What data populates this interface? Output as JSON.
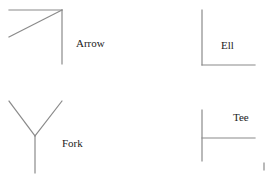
{
  "diagram": {
    "line_color": "#8a8a8a",
    "text_color": "#222222",
    "junctions": [
      {
        "name": "arrow",
        "label": "Arrow"
      },
      {
        "name": "ell",
        "label": "Ell"
      },
      {
        "name": "fork",
        "label": "Fork"
      },
      {
        "name": "tee",
        "label": "Tee"
      }
    ]
  }
}
